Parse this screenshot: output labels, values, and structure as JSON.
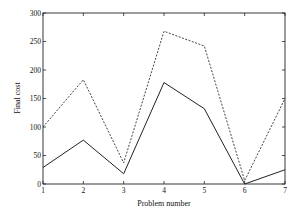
{
  "chart_data": {
    "type": "line",
    "title": "",
    "xlabel": "Problem number",
    "ylabel": "Final cost",
    "x": [
      1,
      2,
      3,
      4,
      5,
      6,
      7
    ],
    "xlim": [
      1,
      7
    ],
    "ylim": [
      0,
      300
    ],
    "xticks": [
      "1",
      "2",
      "3",
      "4",
      "5",
      "6",
      "7"
    ],
    "yticks": [
      "0",
      "50",
      "100",
      "150",
      "200",
      "250",
      "300"
    ],
    "grid": false,
    "legend": null,
    "series": [
      {
        "name": "dashed",
        "style": "dashed",
        "color": "#444444",
        "values": [
          100,
          183,
          37,
          268,
          242,
          6,
          150
        ]
      },
      {
        "name": "solid",
        "style": "solid",
        "color": "#222222",
        "values": [
          29,
          77,
          18,
          178,
          132,
          0,
          25
        ]
      }
    ]
  }
}
